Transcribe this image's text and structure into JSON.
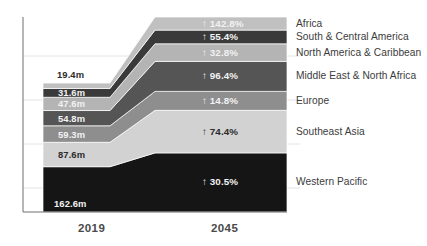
{
  "chart_data": {
    "type": "area",
    "title": "",
    "subtitle": "",
    "xlabel": "",
    "ylabel": "",
    "grid": true,
    "legend_position": "right",
    "categories": [
      "2019",
      "2045"
    ],
    "value_unit": "m",
    "series": [
      {
        "name": "Western Pacific",
        "value_2019": "162.6m",
        "value_2019_num": 162.6,
        "growth_label": "30.5%",
        "growth_pct": 30.5,
        "arrow": "↑",
        "color": "#151515",
        "label_on_dark": true
      },
      {
        "name": "Southeast Asia",
        "value_2019": "87.6m",
        "value_2019_num": 87.6,
        "growth_label": "74.4%",
        "growth_pct": 74.4,
        "arrow": "↑",
        "color": "#d2d2d2",
        "label_on_dark": false
      },
      {
        "name": "Europe",
        "value_2019": "59.3m",
        "value_2019_num": 59.3,
        "growth_label": "14.8%",
        "growth_pct": 14.8,
        "arrow": "↑",
        "color": "#8e8e8e",
        "label_on_dark": true
      },
      {
        "name": "Middle East & North Africa",
        "value_2019": "54.8m",
        "value_2019_num": 54.8,
        "growth_label": "96.4%",
        "growth_pct": 96.4,
        "arrow": "↑",
        "color": "#555555",
        "label_on_dark": true
      },
      {
        "name": "North America & Caribbean",
        "value_2019": "47.6m",
        "value_2019_num": 47.6,
        "growth_label": "32.8%",
        "growth_pct": 32.8,
        "arrow": "↑",
        "color": "#b4b4b4",
        "label_on_dark": true
      },
      {
        "name": "South & Central America",
        "value_2019": "31.6m",
        "value_2019_num": 31.6,
        "growth_label": "55.4%",
        "growth_pct": 55.4,
        "arrow": "↑",
        "color": "#3a3a3a",
        "label_on_dark": true
      },
      {
        "name": "Africa",
        "value_2019": "19.4m",
        "value_2019_num": 19.4,
        "growth_label": "142.8%",
        "growth_pct": 142.8,
        "arrow": "↑",
        "color": "#c0c0c0",
        "label_on_dark": true
      }
    ],
    "axis": {
      "tick_2019": "2019",
      "tick_2045": "2045"
    }
  }
}
